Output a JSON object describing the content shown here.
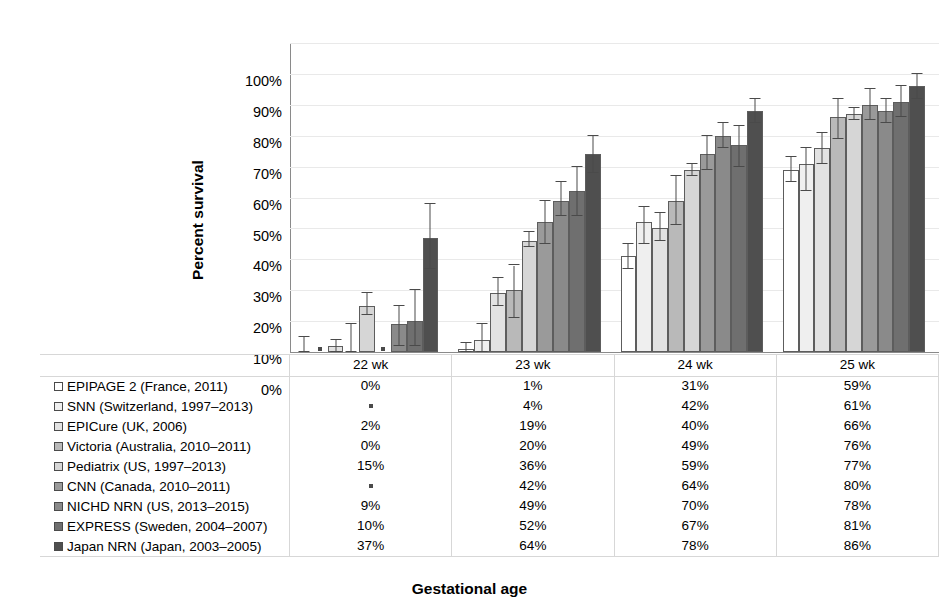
{
  "chart_data": {
    "type": "bar",
    "title": "",
    "xlabel": "Gestational age",
    "ylabel": "Percent survival",
    "categories": [
      "22 wk",
      "23 wk",
      "24 wk",
      "25 wk"
    ],
    "ylim": [
      0,
      100
    ],
    "yticks": [
      "0%",
      "10%",
      "20%",
      "30%",
      "40%",
      "50%",
      "60%",
      "70%",
      "80%",
      "90%",
      "100%"
    ],
    "ytick_values": [
      0,
      10,
      20,
      30,
      40,
      50,
      60,
      70,
      80,
      90,
      100
    ],
    "grid": true,
    "legend_position": "table-below",
    "missing_marker": "*",
    "series": [
      {
        "name": "EPIPAGE 2 (France, 2011)",
        "color": "#ffffff",
        "labels": [
          "0%",
          "1%",
          "31%",
          "59%"
        ],
        "values": [
          0,
          1,
          31,
          59
        ],
        "err_low": [
          0,
          0,
          27,
          55
        ],
        "err_high": [
          5,
          3,
          35,
          63
        ]
      },
      {
        "name": "SNN (Switzerland, 1997–2013)",
        "color": "#efefef",
        "labels": [
          "*",
          "4%",
          "42%",
          "61%"
        ],
        "values": [
          null,
          4,
          42,
          61
        ],
        "err_low": [
          null,
          0,
          35,
          52
        ],
        "err_high": [
          null,
          9,
          47,
          66
        ]
      },
      {
        "name": "EPICure (UK, 2006)",
        "color": "#e2e2e2",
        "labels": [
          "2%",
          "19%",
          "40%",
          "66%"
        ],
        "values": [
          2,
          19,
          40,
          66
        ],
        "err_low": [
          0,
          15,
          36,
          61
        ],
        "err_high": [
          4,
          24,
          45,
          71
        ]
      },
      {
        "name": "Victoria (Australia, 2010–2011)",
        "color": "#b9b9b9",
        "labels": [
          "0%",
          "20%",
          "49%",
          "76%"
        ],
        "values": [
          0,
          20,
          49,
          76
        ],
        "err_low": [
          0,
          11,
          41,
          69
        ],
        "err_high": [
          9,
          28,
          57,
          82
        ]
      },
      {
        "name": "Pediatrix (US, 1997–2013)",
        "color": "#d6d6d6",
        "labels": [
          "15%",
          "36%",
          "59%",
          "77%"
        ],
        "values": [
          15,
          36,
          59,
          77
        ],
        "err_low": [
          12,
          34,
          57,
          75
        ],
        "err_high": [
          19,
          39,
          61,
          79
        ]
      },
      {
        "name": "CNN (Canada, 2010–2011)",
        "color": "#9a9a9a",
        "labels": [
          "*",
          "42%",
          "64%",
          "80%"
        ],
        "values": [
          null,
          42,
          64,
          80
        ],
        "err_low": [
          null,
          35,
          59,
          75
        ],
        "err_high": [
          null,
          49,
          70,
          85
        ]
      },
      {
        "name": "NICHD NRN (US, 2013–2015)",
        "color": "#8a8a8a",
        "labels": [
          "9%",
          "49%",
          "70%",
          "78%"
        ],
        "values": [
          9,
          49,
          70,
          78
        ],
        "err_low": [
          2,
          44,
          66,
          74
        ],
        "err_high": [
          15,
          55,
          74,
          82
        ]
      },
      {
        "name": "EXPRESS (Sweden, 2004–2007)",
        "color": "#6f6f6f",
        "labels": [
          "10%",
          "52%",
          "67%",
          "81%"
        ],
        "values": [
          10,
          52,
          67,
          81
        ],
        "err_low": [
          2,
          44,
          60,
          76
        ],
        "err_high": [
          20,
          60,
          73,
          86
        ]
      },
      {
        "name": "Japan NRN (Japan, 2003–2005)",
        "color": "#4f4f4f",
        "labels": [
          "37%",
          "64%",
          "78%",
          "86%"
        ],
        "values": [
          37,
          64,
          78,
          86
        ],
        "err_low": [
          27,
          58,
          74,
          82
        ],
        "err_high": [
          48,
          70,
          82,
          90
        ]
      }
    ]
  },
  "table": {
    "header_label": "",
    "headers": [
      "22 wk",
      "23 wk",
      "24 wk",
      "25 wk"
    ]
  }
}
